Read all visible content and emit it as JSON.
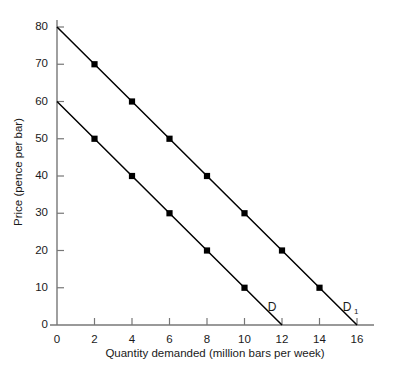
{
  "chart_data": {
    "type": "line",
    "title": "",
    "xlabel": "Quantity demanded (million bars per week)",
    "ylabel": "Price (pence per bar)",
    "xlim": [
      0,
      16
    ],
    "ylim": [
      0,
      80
    ],
    "xticks": [
      0,
      2,
      4,
      6,
      8,
      10,
      12,
      14,
      16
    ],
    "yticks": [
      0,
      10,
      20,
      30,
      40,
      50,
      60,
      70,
      80
    ],
    "xtick_labels": [
      "0",
      "2",
      "4",
      "6",
      "8",
      "10",
      "12",
      "14",
      "16"
    ],
    "ytick_labels": [
      "0",
      "10",
      "20",
      "30",
      "40",
      "50",
      "60",
      "70",
      "80"
    ],
    "grid": false,
    "legend": "inline-endpoint-labels",
    "marker": "square",
    "marker_color": "#000000",
    "line_color": "#000000",
    "axis_color": "#777777",
    "background": "#ffffff",
    "series": [
      {
        "name": "D",
        "label": "D",
        "label_base": "D",
        "label_sub": "",
        "x": [
          0,
          2,
          4,
          6,
          8,
          10,
          12
        ],
        "y": [
          60,
          50,
          40,
          30,
          20,
          10,
          0
        ],
        "marker_x": [
          2,
          4,
          6,
          8,
          10
        ],
        "marker_y": [
          50,
          40,
          30,
          20,
          10
        ],
        "endpoint": [
          12,
          0
        ]
      },
      {
        "name": "D1",
        "label": "D₁",
        "label_base": "D",
        "label_sub": "1",
        "x": [
          0,
          2,
          4,
          6,
          8,
          10,
          12,
          14,
          16
        ],
        "y": [
          80,
          70,
          60,
          50,
          40,
          30,
          20,
          10,
          0
        ],
        "marker_x": [
          2,
          4,
          6,
          8,
          10,
          12,
          14
        ],
        "marker_y": [
          70,
          60,
          50,
          40,
          30,
          20,
          10
        ],
        "endpoint": [
          16,
          0
        ]
      }
    ]
  }
}
